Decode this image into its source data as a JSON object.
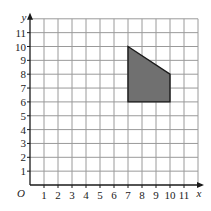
{
  "diagram": {
    "type": "coordinate-grid",
    "x_axis": {
      "label": "x",
      "ticks": [
        "1",
        "2",
        "3",
        "4",
        "5",
        "6",
        "7",
        "8",
        "9",
        "10",
        "11"
      ],
      "grid_max": 12
    },
    "y_axis": {
      "label": "y",
      "ticks": [
        "1",
        "2",
        "3",
        "4",
        "5",
        "6",
        "7",
        "8",
        "9",
        "10",
        "11"
      ],
      "grid_max": 12
    },
    "origin_label": "O",
    "shape": {
      "name": "quadrilateral",
      "vertices": [
        [
          7,
          10
        ],
        [
          10,
          8
        ],
        [
          10,
          6
        ],
        [
          7,
          6
        ]
      ],
      "fill": "#707070",
      "stroke": "#1a1a1a"
    },
    "colors": {
      "grid": "#9a9a9a",
      "axis": "#1a1a1a"
    }
  }
}
